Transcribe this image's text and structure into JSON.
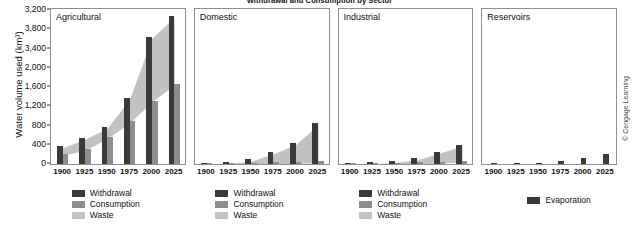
{
  "chart_data": {
    "type": "bar",
    "title": "Withdrawal and Consumption by Sector",
    "ylabel": "Water volume used (km³)",
    "xlabel": "",
    "grid": false,
    "legend_position": "below-panels",
    "ytick_labels": [
      "3,200",
      "3,800",
      "3,400",
      "2,000",
      "1,600",
      "1,200",
      "800",
      "400",
      "0"
    ],
    "ylim": [
      0,
      3200
    ],
    "categories": [
      "1900",
      "1925",
      "1950",
      "1975",
      "2000",
      "2025"
    ],
    "panels": [
      {
        "name": "Agricultural",
        "series": [
          {
            "name": "Withdrawal",
            "values": [
              500,
              740,
              1050,
              1870,
              3590,
              4180
            ]
          },
          {
            "name": "Consumption",
            "values": [
              290,
              430,
              760,
              1200,
              1790,
              2270
            ]
          }
        ],
        "legend": [
          "Withdrawal",
          "Consumption",
          "Waste"
        ]
      },
      {
        "name": "Domestic",
        "series": [
          {
            "name": "Withdrawal",
            "values": [
              22,
              55,
              130,
              330,
              590,
              1150
            ]
          },
          {
            "name": "Consumption",
            "values": [
              8,
              16,
              30,
              45,
              60,
              80
            ]
          }
        ],
        "legend": [
          "Withdrawal",
          "Consumption",
          "Waste"
        ]
      },
      {
        "name": "Industrial",
        "series": [
          {
            "name": "Withdrawal",
            "values": [
              20,
              45,
              90,
              160,
              350,
              550
            ]
          },
          {
            "name": "Consumption",
            "values": [
              5,
              12,
              25,
              45,
              70,
              95
            ]
          }
        ],
        "legend": [
          "Withdrawal",
          "Consumption",
          "Waste"
        ]
      },
      {
        "name": "Reservoirs",
        "series": [
          {
            "name": "Evaporation",
            "values": [
              2,
              10,
              18,
              75,
              160,
              270
            ]
          }
        ],
        "legend": [
          "Evaporation"
        ]
      }
    ]
  },
  "credit": "© Cengage Learning"
}
